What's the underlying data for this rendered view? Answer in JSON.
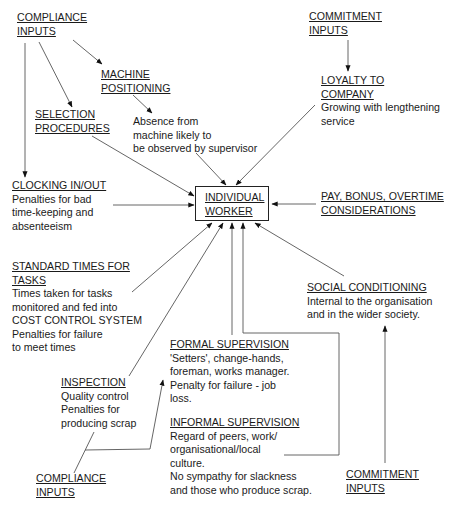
{
  "diagram": {
    "center": {
      "title_line1": "INDIVIDUAL",
      "title_line2": "WORKER"
    },
    "nodes": {
      "compliance_top": {
        "title": [
          "COMPLIANCE",
          "INPUTS"
        ]
      },
      "commitment_top": {
        "title": [
          "COMMITMENT",
          "INPUTS"
        ]
      },
      "machine_positioning": {
        "title": [
          "MACHINE",
          "POSITIONING"
        ],
        "body": [
          "Absence from",
          "machine likely to",
          "be observed by supervisor"
        ]
      },
      "loyalty": {
        "title": [
          "LOYALTY TO",
          "COMPANY"
        ],
        "body": [
          "Growing with lengthening",
          "service"
        ]
      },
      "selection": {
        "title": [
          "SELECTION",
          "PROCEDURES"
        ]
      },
      "clocking": {
        "title": [
          "CLOCKING IN/OUT"
        ],
        "body": [
          "Penalties for bad",
          "time-keeping and",
          "absenteeism"
        ]
      },
      "pay": {
        "title": [
          "PAY, BONUS, OVERTIME",
          "CONSIDERATIONS"
        ]
      },
      "standard_times": {
        "title": [
          "STANDARD TIMES FOR",
          "TASKS"
        ],
        "body": [
          "Times taken for tasks",
          "monitored and fed into",
          "COST CONTROL SYSTEM",
          "Penalties for failure",
          "to meet times"
        ]
      },
      "social": {
        "title": [
          "SOCIAL CONDITIONING"
        ],
        "body": [
          "Internal to the organisation",
          "and in the wider society."
        ]
      },
      "formal": {
        "title": [
          "FORMAL SUPERVISION"
        ],
        "body": [
          "'Setters', change-hands,",
          "foreman, works manager.",
          "Penalty for failure - job",
          "loss."
        ]
      },
      "inspection": {
        "title": [
          "INSPECTION"
        ],
        "body": [
          "Quality control",
          "Penalties for",
          "producing scrap"
        ]
      },
      "informal": {
        "title": [
          "INFORMAL SUPERVISION"
        ],
        "body": [
          "Regard of peers, work/",
          "organisational/local",
          "culture.",
          "No sympathy for slackness",
          "and those who produce scrap."
        ]
      },
      "compliance_bottom": {
        "title": [
          "COMPLIANCE",
          "INPUTS"
        ]
      },
      "commitment_bottom": {
        "title": [
          "COMMITMENT",
          "INPUTS"
        ]
      }
    },
    "colors": {
      "ink": "#1a1a1a",
      "line": "#555555",
      "background": "#ffffff"
    }
  }
}
